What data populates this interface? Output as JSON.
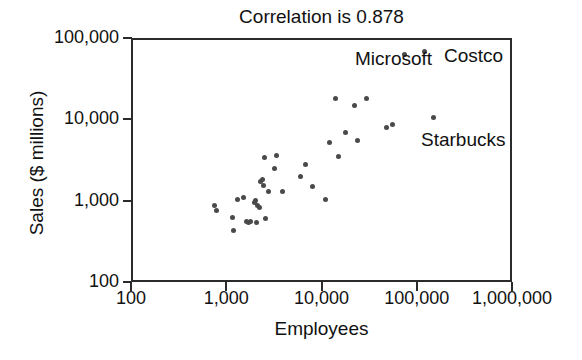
{
  "chart_data": {
    "type": "scatter",
    "title": "Correlation is 0.878",
    "xlabel": "Employees",
    "ylabel": "Sales ($ millions)",
    "xscale": "log",
    "yscale": "log",
    "xlim": [
      100,
      1000000
    ],
    "ylim": [
      100,
      100000
    ],
    "grid": false,
    "legend": "none",
    "correlation": 0.878,
    "xticks": [
      100,
      1000,
      10000,
      100000,
      1000000
    ],
    "xticklabels": [
      "100",
      "1,000",
      "10,000",
      "100,000",
      "1,000,000"
    ],
    "yticks": [
      100,
      1000,
      10000,
      100000
    ],
    "yticklabels": [
      "100",
      "1,000",
      "10,000",
      "100,000"
    ],
    "marker_color": "#4a4a4a",
    "points": [
      {
        "x": 760,
        "y": 870
      },
      {
        "x": 790,
        "y": 760
      },
      {
        "x": 1150,
        "y": 620
      },
      {
        "x": 1180,
        "y": 430
      },
      {
        "x": 1300,
        "y": 1020
      },
      {
        "x": 1500,
        "y": 1080
      },
      {
        "x": 1620,
        "y": 560
      },
      {
        "x": 1700,
        "y": 540
      },
      {
        "x": 1800,
        "y": 560
      },
      {
        "x": 2000,
        "y": 950
      },
      {
        "x": 2050,
        "y": 1000
      },
      {
        "x": 2100,
        "y": 540
      },
      {
        "x": 2150,
        "y": 870
      },
      {
        "x": 2250,
        "y": 830
      },
      {
        "x": 2300,
        "y": 1700
      },
      {
        "x": 2400,
        "y": 1800
      },
      {
        "x": 2450,
        "y": 1550
      },
      {
        "x": 2500,
        "y": 3400
      },
      {
        "x": 2600,
        "y": 600
      },
      {
        "x": 2800,
        "y": 1300
      },
      {
        "x": 3200,
        "y": 2500
      },
      {
        "x": 3400,
        "y": 3600
      },
      {
        "x": 3900,
        "y": 1300
      },
      {
        "x": 6000,
        "y": 2000
      },
      {
        "x": 6800,
        "y": 2750
      },
      {
        "x": 8000,
        "y": 1480
      },
      {
        "x": 11000,
        "y": 1020
      },
      {
        "x": 12000,
        "y": 5200
      },
      {
        "x": 14000,
        "y": 18000
      },
      {
        "x": 15000,
        "y": 3500
      },
      {
        "x": 18000,
        "y": 6800
      },
      {
        "x": 22000,
        "y": 15000
      },
      {
        "x": 24000,
        "y": 5500
      },
      {
        "x": 30000,
        "y": 18000
      },
      {
        "x": 48000,
        "y": 8000
      },
      {
        "x": 55000,
        "y": 8600
      },
      {
        "x": 75000,
        "y": 62000
      },
      {
        "x": 120000,
        "y": 68000
      },
      {
        "x": 150000,
        "y": 10500
      }
    ],
    "annotations": [
      {
        "text": "Microsoft",
        "x_px": 355,
        "y_px": 48
      },
      {
        "text": "Costco",
        "x_px": 444,
        "y_px": 45
      },
      {
        "text": "Starbucks",
        "x_px": 421,
        "y_px": 129
      }
    ]
  }
}
